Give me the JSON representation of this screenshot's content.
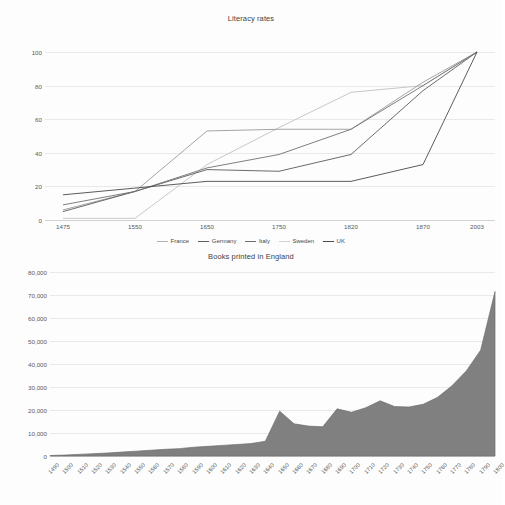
{
  "charts": [
    {
      "title": "Literacy rates",
      "yaxis": {
        "ticks": [
          "0",
          "20",
          "40",
          "60",
          "80",
          "100"
        ],
        "min": 0,
        "max": 100
      },
      "xaxis": {
        "ticks": [
          "1475",
          "1550",
          "1650",
          "1750",
          "1820",
          "1870",
          "2003"
        ]
      },
      "legend": [
        {
          "label": "France",
          "color": "#9a9a9a"
        },
        {
          "label": "Germany",
          "color": "#707070"
        },
        {
          "label": "Italy",
          "color": "#5a5a5a"
        },
        {
          "label": "Sweden",
          "color": "#c2c2c2"
        },
        {
          "label": "UK",
          "color": "#4a4a4a"
        }
      ]
    },
    {
      "title": "Books printed in England",
      "yaxis": {
        "ticks": [
          "0",
          "10,000",
          "20,000",
          "30,000",
          "40,000",
          "50,000",
          "60,000",
          "70,000",
          "80,000"
        ],
        "min": 0,
        "max": 80000
      },
      "xaxis": {
        "ticks": [
          "1490",
          "1500",
          "1510",
          "1520",
          "1530",
          "1540",
          "1550",
          "1560",
          "1570",
          "1580",
          "1590",
          "1600",
          "1610",
          "1620",
          "1630",
          "1640",
          "1650",
          "1660",
          "1670",
          "1680",
          "1690",
          "1700",
          "1710",
          "1720",
          "1730",
          "1740",
          "1750",
          "1760",
          "1770",
          "1780",
          "1790",
          "1800"
        ]
      },
      "fill_color": "#808080",
      "stroke_color": "#6f6f6f"
    }
  ],
  "chart_data": [
    {
      "type": "line",
      "title": "Literacy rates",
      "xlabel": "",
      "ylabel": "",
      "ylim": [
        0,
        100
      ],
      "grid": true,
      "legend_position": "bottom",
      "categories": [
        "1475",
        "1550",
        "1650",
        "1750",
        "1820",
        "1870",
        "2003"
      ],
      "series": [
        {
          "name": "France",
          "color": "#9a9a9a",
          "values": [
            6,
            17,
            53,
            54,
            54,
            82,
            100
          ]
        },
        {
          "name": "Germany",
          "color": "#707070",
          "values": [
            9,
            17,
            31,
            39,
            54,
            80,
            100
          ]
        },
        {
          "name": "Italy",
          "color": "#5a5a5a",
          "values": [
            5,
            17,
            30,
            29,
            39,
            77,
            100
          ]
        },
        {
          "name": "Sweden",
          "color": "#c2c2c2",
          "values": [
            1,
            1,
            33,
            55,
            76,
            80,
            100
          ]
        },
        {
          "name": "UK",
          "color": "#4a4a4a",
          "values": [
            15,
            19,
            23,
            23,
            23,
            33,
            100
          ]
        }
      ]
    },
    {
      "type": "area",
      "title": "Books printed in England",
      "xlabel": "",
      "ylabel": "",
      "ylim": [
        0,
        80000
      ],
      "grid": true,
      "legend_position": "none",
      "fill_color": "#808080",
      "x": [
        "1490",
        "1500",
        "1510",
        "1520",
        "1530",
        "1540",
        "1550",
        "1560",
        "1570",
        "1580",
        "1590",
        "1600",
        "1610",
        "1620",
        "1630",
        "1640",
        "1650",
        "1660",
        "1670",
        "1680",
        "1690",
        "1700",
        "1710",
        "1720",
        "1730",
        "1740",
        "1750",
        "1760",
        "1770",
        "1780",
        "1790",
        "1800"
      ],
      "values": [
        200,
        400,
        700,
        1000,
        1300,
        1700,
        2100,
        2500,
        2900,
        3200,
        3800,
        4200,
        4600,
        5000,
        5400,
        6400,
        19500,
        14000,
        13000,
        12700,
        20500,
        19000,
        21000,
        24000,
        21500,
        21300,
        22500,
        25500,
        30500,
        37000,
        46000,
        71500
      ]
    }
  ]
}
